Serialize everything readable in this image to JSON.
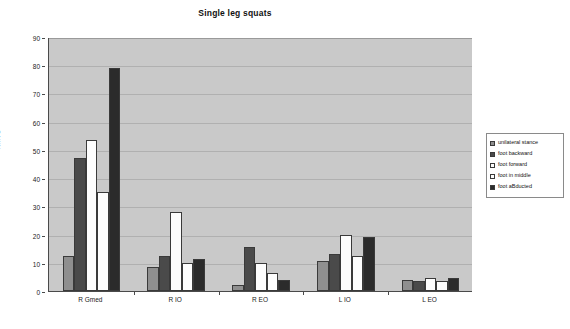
{
  "chart_data": {
    "type": "bar",
    "title": "Single leg squats",
    "xlabel": "",
    "ylabel": "%MVC",
    "ylim": [
      0,
      90
    ],
    "ytick_step": 10,
    "yticks": [
      0,
      10,
      20,
      30,
      40,
      50,
      60,
      70,
      80,
      90
    ],
    "grid": true,
    "legend_position": "right",
    "categories": [
      "R Gmed",
      "R IO",
      "R EO",
      "L IO",
      "L EO"
    ],
    "series": [
      {
        "name": "unilateral stance",
        "color": "#8f8f8f",
        "values": [
          12.5,
          8.5,
          2.0,
          10.5,
          4.0
        ]
      },
      {
        "name": "foot backward",
        "color": "#4a4a4a",
        "values": [
          47.0,
          12.5,
          15.5,
          13.0,
          3.5
        ]
      },
      {
        "name": "foot forward",
        "color": "#fdfdfd",
        "values": [
          53.5,
          28.0,
          10.0,
          20.0,
          4.5
        ]
      },
      {
        "name": "foot in middle",
        "color": "#fdfdfd",
        "values": [
          35.0,
          10.0,
          6.5,
          12.5,
          3.5
        ]
      },
      {
        "name": "foot aBducted",
        "color": "#2b2b2b",
        "values": [
          79.0,
          11.5,
          4.0,
          19.0,
          4.5
        ]
      }
    ]
  },
  "axis": {
    "y_title": "%MVC"
  }
}
